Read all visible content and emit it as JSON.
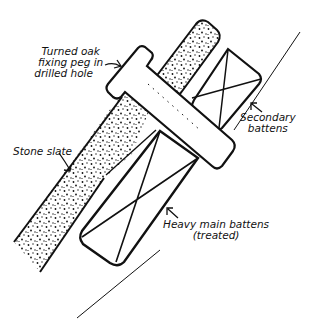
{
  "diagram": {
    "colors": {
      "ink": "#111111",
      "paper": "#ffffff"
    },
    "labels": {
      "peg": {
        "line1": "Turned oak",
        "line2": "fixing peg in",
        "line3": "drilled hole"
      },
      "stone_slate": "Stone slate",
      "secondary": {
        "line1": "Secondary",
        "line2": "battens"
      },
      "main": {
        "line1": "Heavy main battens",
        "line2": "(treated)"
      }
    },
    "components": [
      {
        "id": "stone-slate-lower",
        "description": "stippled stone slate, lower"
      },
      {
        "id": "stone-slate-upper",
        "description": "stippled stone slate, upper"
      },
      {
        "id": "oak-peg",
        "description": "turned oak fixing peg through drilled hole"
      },
      {
        "id": "secondary-batten",
        "description": "secondary batten with cross"
      },
      {
        "id": "main-batten",
        "description": "heavy main batten with cross"
      },
      {
        "id": "rafter-line",
        "description": "diagonal rafter line"
      }
    ]
  }
}
